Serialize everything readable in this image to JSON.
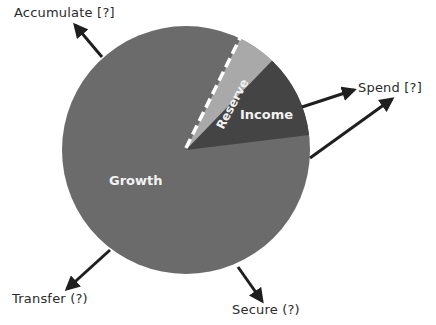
{
  "diagram": {
    "type": "pie-with-flow-arrows",
    "colors": {
      "growth": "#6b6b6b",
      "income": "#444444",
      "reserve": "#a9a9a9",
      "arrow": "#1f1f1f",
      "text": "#2b2b2b",
      "slice_text": "#f2f2f2",
      "divider": "#ffffff"
    },
    "slices": [
      {
        "name": "Growth",
        "label": "Growth",
        "degrees": 303
      },
      {
        "name": "Reserve",
        "label": "Reserve",
        "degrees": 18
      },
      {
        "name": "Income",
        "label": "Income",
        "degrees": 39
      }
    ],
    "arrows": [
      {
        "label": "Accumulate [?]",
        "direction": "up-left"
      },
      {
        "label": "Spend [?]",
        "direction": "right",
        "count": 2
      },
      {
        "label": "Transfer (?)",
        "direction": "down-left"
      },
      {
        "label": "Secure (?)",
        "direction": "down-right"
      }
    ]
  },
  "labels": {
    "accumulate": "Accumulate [?]",
    "spend": "Spend [?]",
    "transfer": "Transfer (?)",
    "secure": "Secure (?)",
    "growth": "Growth",
    "income": "Income",
    "reserve": "Reserve"
  }
}
